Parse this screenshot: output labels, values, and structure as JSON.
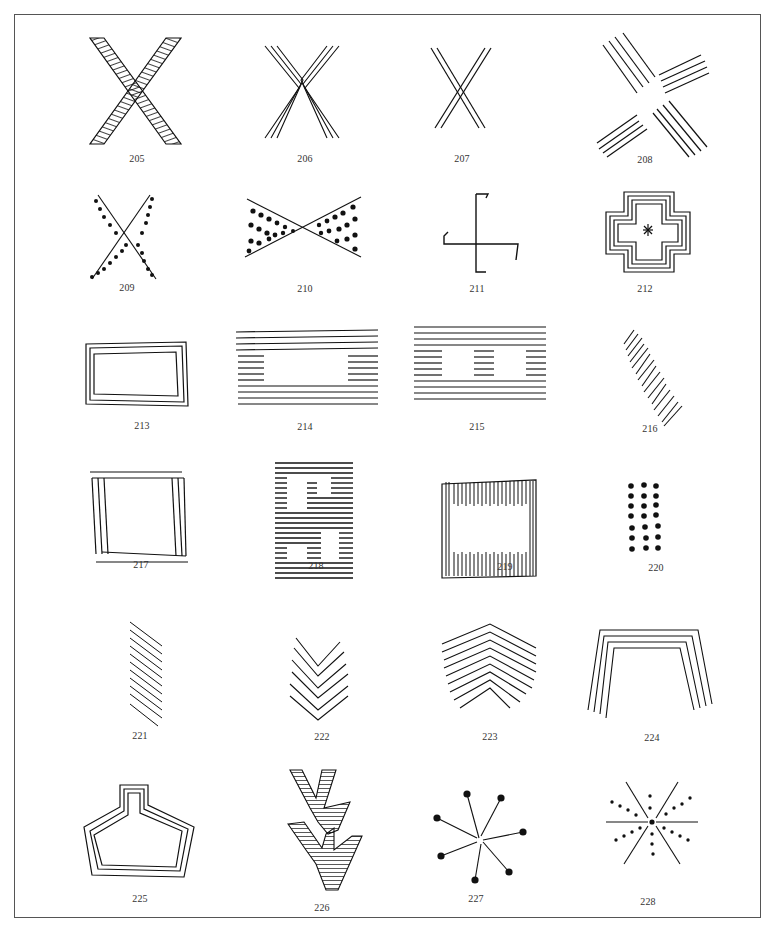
{
  "plate": {
    "figures": [
      {
        "number": "205",
        "motif": "hatched-x"
      },
      {
        "number": "206",
        "motif": "triple-line-x"
      },
      {
        "number": "207",
        "motif": "double-line-x"
      },
      {
        "number": "208",
        "motif": "quadruple-line-cross"
      },
      {
        "number": "209",
        "motif": "dotted-x"
      },
      {
        "number": "210",
        "motif": "dotted-hourglass"
      },
      {
        "number": "211",
        "motif": "swastika-fylfot"
      },
      {
        "number": "212",
        "motif": "stepped-cross-with-star"
      },
      {
        "number": "213",
        "motif": "double-framed-rectangle"
      },
      {
        "number": "214",
        "motif": "striped-band-with-panel"
      },
      {
        "number": "215",
        "motif": "striped-band-with-two-panels"
      },
      {
        "number": "216",
        "motif": "diagonal-hatched-band"
      },
      {
        "number": "217",
        "motif": "open-frame-with-double-sides"
      },
      {
        "number": "218",
        "motif": "striped-fret-meander"
      },
      {
        "number": "219",
        "motif": "vertical-hatched-frame"
      },
      {
        "number": "220",
        "motif": "dot-grid-3x7"
      },
      {
        "number": "221",
        "motif": "slanted-parallel-lines"
      },
      {
        "number": "222",
        "motif": "nested-chevrons"
      },
      {
        "number": "223",
        "motif": "nested-inverted-chevrons"
      },
      {
        "number": "224",
        "motif": "nested-arch-lines"
      },
      {
        "number": "225",
        "motif": "bottle-outline-triple"
      },
      {
        "number": "226",
        "motif": "hatched-branching-y"
      },
      {
        "number": "227",
        "motif": "dotted-star-burst"
      },
      {
        "number": "228",
        "motif": "six-ray-star-with-dots"
      }
    ]
  }
}
